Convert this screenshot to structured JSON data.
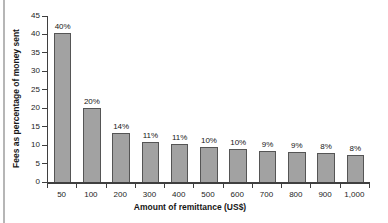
{
  "chart_data": {
    "type": "bar",
    "title": "",
    "categories": [
      "50",
      "100",
      "200",
      "300",
      "400",
      "500",
      "600",
      "700",
      "800",
      "900",
      "1,000"
    ],
    "values": [
      40,
      20,
      14,
      11,
      11,
      10,
      10,
      9,
      9,
      8,
      8
    ],
    "bar_labels": [
      "40%",
      "20%",
      "14%",
      "11%",
      "11%",
      "10%",
      "10%",
      "9%",
      "9%",
      "8%",
      "8%"
    ],
    "display_heights": [
      40.3,
      20,
      13.3,
      10.9,
      10.2,
      9.6,
      8.9,
      8.5,
      8.2,
      7.9,
      7.2
    ],
    "xlabel": "Amount of remittance (US$)",
    "ylabel": "Fees as percentage of money sent",
    "ylim": [
      0,
      45
    ],
    "yticks": [
      0,
      5,
      10,
      15,
      20,
      25,
      30,
      35,
      40,
      45
    ],
    "grid": false,
    "legend_position": "none",
    "colors": {
      "bar_fill": "#a2a2a2",
      "bar_border": "#555555",
      "axis": "#3f3f3f",
      "text": "#1c1c1c",
      "page_edge": "#b6b6b6",
      "background": "#ffffff"
    }
  }
}
